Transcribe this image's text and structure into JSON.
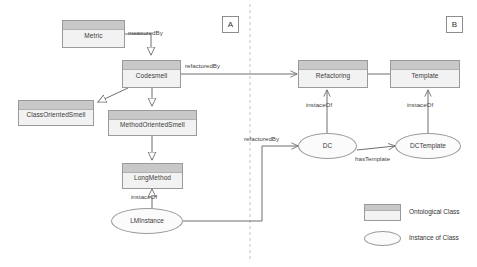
{
  "diagram": {
    "type": "ontology-uml-diagram",
    "sections": [
      {
        "id": "A",
        "label": "A"
      },
      {
        "id": "B",
        "label": "B"
      }
    ],
    "divider": {
      "style": "dashed",
      "orientation": "vertical"
    },
    "classes": [
      {
        "id": "metric",
        "label": "Metric",
        "kind": "ontological-class"
      },
      {
        "id": "codesmell",
        "label": "Codesmell",
        "kind": "ontological-class"
      },
      {
        "id": "class-oriented-smell",
        "label": "ClassOrientedSmell",
        "kind": "ontological-class"
      },
      {
        "id": "method-oriented-smell",
        "label": "MethodOrientedSmell",
        "kind": "ontological-class"
      },
      {
        "id": "long-method",
        "label": "LongMethod",
        "kind": "ontological-class"
      },
      {
        "id": "refactoring",
        "label": "Refactoring",
        "kind": "ontological-class"
      },
      {
        "id": "template",
        "label": "Template",
        "kind": "ontological-class"
      }
    ],
    "instances": [
      {
        "id": "lm-instance",
        "label": "LMInstance",
        "kind": "instance-of-class"
      },
      {
        "id": "dc",
        "label": "DC",
        "kind": "instance-of-class"
      },
      {
        "id": "dc-template",
        "label": "DCTemplate",
        "kind": "instance-of-class"
      }
    ],
    "relations": [
      {
        "id": "metric-measuredby-codesmell",
        "label": "measuredBy",
        "from": "metric",
        "to": "codesmell",
        "arrow": "open-triangle"
      },
      {
        "id": "codesmell-refactoredby-refactoring",
        "label": "refactoredBy",
        "from": "codesmell",
        "to": "refactoring",
        "arrow": "open-arrow"
      },
      {
        "id": "codesmell-gen-classoriented",
        "label": "",
        "from": "codesmell",
        "to": "class-oriented-smell",
        "arrow": "hollow-triangle"
      },
      {
        "id": "codesmell-gen-methodoriented",
        "label": "",
        "from": "codesmell",
        "to": "method-oriented-smell",
        "arrow": "hollow-triangle"
      },
      {
        "id": "methodoriented-gen-longmethod",
        "label": "",
        "from": "method-oriented-smell",
        "to": "long-method",
        "arrow": "hollow-triangle"
      },
      {
        "id": "lminstance-instaceof-longmethod",
        "label": "instaceOf",
        "from": "lm-instance",
        "to": "long-method",
        "arrow": "hollow-triangle"
      },
      {
        "id": "lminstance-refactoredby-dc",
        "label": "refactoredBy",
        "from": "lm-instance",
        "to": "dc",
        "arrow": "open-arrow"
      },
      {
        "id": "dc-instaceof-refactoring",
        "label": "instaceOf",
        "from": "dc",
        "to": "refactoring",
        "arrow": "open-arrow"
      },
      {
        "id": "dctemplate-instaceof-template",
        "label": "instaceOf",
        "from": "dc-template",
        "to": "template",
        "arrow": "open-arrow"
      },
      {
        "id": "refactoring-template-link",
        "label": "",
        "from": "refactoring",
        "to": "template",
        "arrow": "none"
      },
      {
        "id": "dc-hastemplate-dctemplate",
        "label": "hasTemplate",
        "from": "dc",
        "to": "dc-template",
        "arrow": "open-arrow"
      }
    ],
    "edge_labels": {
      "measured_by": "measuredBy",
      "refactored_by_top": "refactoredBy",
      "refactored_by_bottom": "refactoredBy",
      "instace_of_lm": "instaceOf",
      "instace_of_dc": "instaceOf",
      "instace_of_dctemplate": "instaceOf",
      "has_template": "hasTemplate"
    },
    "legend": {
      "items": [
        {
          "id": "ontological-class",
          "label": "Ontological Class",
          "shape": "rectangle"
        },
        {
          "id": "instance-of-class",
          "label": "Instance of Class",
          "shape": "ellipse"
        }
      ]
    },
    "colors": {
      "box_header": "#c8c8c8",
      "box_body": "#f2f2f2",
      "ellipse_body": "#fbfbfb",
      "stroke": "#9a9a9a",
      "edge": "#6e6e6e",
      "text": "#3a3a3a",
      "background": "#ffffff"
    }
  }
}
